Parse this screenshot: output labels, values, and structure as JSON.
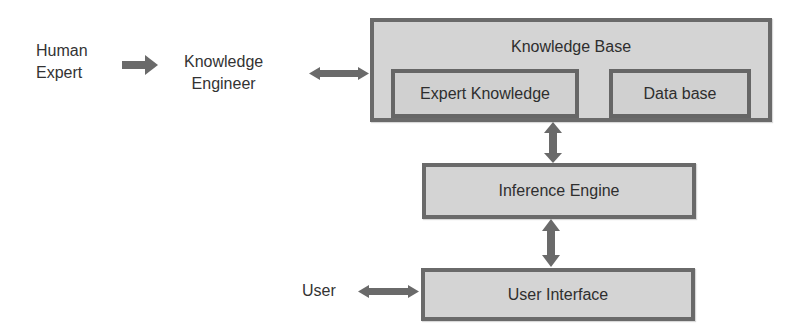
{
  "diagram": {
    "actors": {
      "human_expert": [
        "Human",
        "Expert"
      ],
      "knowledge_engineer": [
        "Knowledge",
        "Engineer"
      ],
      "user": "User"
    },
    "knowledge_base": {
      "title": "Knowledge Base",
      "components": [
        "Expert Knowledge",
        "Data base"
      ]
    },
    "inference_engine": "Inference Engine",
    "user_interface": "User Interface",
    "connections": [
      {
        "from": "Human Expert",
        "to": "Knowledge Engineer",
        "type": "one-way"
      },
      {
        "from": "Knowledge Engineer",
        "to": "Knowledge Base",
        "type": "two-way"
      },
      {
        "from": "Knowledge Base",
        "to": "Inference Engine",
        "type": "two-way"
      },
      {
        "from": "Inference Engine",
        "to": "User Interface",
        "type": "two-way"
      },
      {
        "from": "User",
        "to": "User Interface",
        "type": "two-way"
      }
    ],
    "colors": {
      "box_fill": "#d4d4d4",
      "box_border": "#6a6a6a",
      "arrow": "#6a6a6a"
    }
  }
}
